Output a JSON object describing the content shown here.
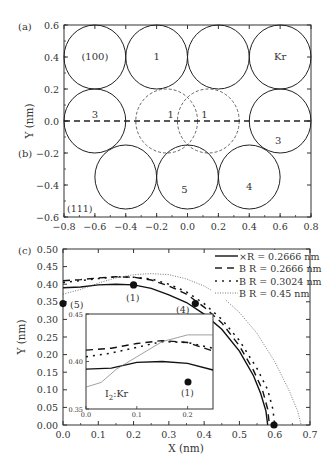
{
  "chart_data": [
    {
      "type": "scatter",
      "panel": "(a)/(b)",
      "title": "",
      "panel_labels": [
        "(a)",
        "(b)"
      ],
      "xlabel": "",
      "ylabel": "Y (nm)",
      "xlim": [
        -0.8,
        0.8
      ],
      "ylim": [
        -0.6,
        0.6
      ],
      "xticks": [
        "-0.8",
        "-0.6",
        "-0.4",
        "-0.2",
        "0.0",
        "0.2",
        "0.4",
        "0.6",
        "0.8"
      ],
      "yticks": [
        "0.6",
        "0.4",
        "0.2",
        "0.0",
        "-0.2",
        "-0.4",
        "-0.6"
      ],
      "annotations": [
        "(100)",
        "(111)"
      ],
      "circles_top_solid": [
        {
          "cx": -0.6,
          "cy": 0.4,
          "r": 0.2,
          "label": "(100)"
        },
        {
          "cx": -0.2,
          "cy": 0.4,
          "r": 0.2,
          "label": "1"
        },
        {
          "cx": 0.2,
          "cy": 0.4,
          "r": 0.2,
          "label": ""
        },
        {
          "cx": 0.6,
          "cy": 0.4,
          "r": 0.2,
          "label": "Kr"
        },
        {
          "cx": -0.6,
          "cy": 0.0,
          "r": 0.2,
          "label": "3"
        },
        {
          "cx": 0.6,
          "cy": 0.0,
          "r": 0.2,
          "label": "3"
        }
      ],
      "circles_dashed": [
        {
          "cx": -0.135,
          "cy": 0.0,
          "r": 0.2,
          "label": "1"
        },
        {
          "cx": 0.135,
          "cy": 0.0,
          "r": 0.2,
          "label": "1"
        }
      ],
      "circles_bottom_solid": [
        {
          "cx": -0.4,
          "cy": -0.35,
          "r": 0.2,
          "label": ""
        },
        {
          "cx": 0.0,
          "cy": -0.35,
          "r": 0.2,
          "label": "5"
        },
        {
          "cx": 0.4,
          "cy": -0.35,
          "r": 0.2,
          "label": "4"
        }
      ],
      "dashed_axis_line": {
        "y": 0.0,
        "x_from": -0.8,
        "x_to": 0.8
      },
      "grid": false
    },
    {
      "type": "line",
      "panel": "(c)",
      "panel_label": "(c)",
      "title": "",
      "xlabel": "X (nm)",
      "ylabel": "Y (nm)",
      "xlim": [
        0.0,
        0.7
      ],
      "ylim": [
        0.0,
        0.5
      ],
      "xticks": [
        "0.0",
        "0.1",
        "0.2",
        "0.3",
        "0.4",
        "0.5",
        "0.6",
        "0.7"
      ],
      "yticks": [
        "0.00",
        "0.05",
        "0.10",
        "0.15",
        "0.20",
        "0.25",
        "0.30",
        "0.35",
        "0.40",
        "0.45",
        "0.50"
      ],
      "legend_position": "upper right",
      "series": [
        {
          "name": "×R = 0.2666 nm",
          "style": "solid",
          "x": [
            0.0,
            0.05,
            0.1,
            0.15,
            0.2,
            0.25,
            0.3,
            0.35,
            0.4,
            0.45,
            0.5,
            0.54,
            0.56,
            0.575,
            0.58
          ],
          "y": [
            0.39,
            0.392,
            0.398,
            0.4,
            0.398,
            0.388,
            0.37,
            0.348,
            0.315,
            0.272,
            0.21,
            0.14,
            0.09,
            0.04,
            0.0
          ]
        },
        {
          "name": "B R = 0.2666 nm",
          "style": "dash",
          "x": [
            0.0,
            0.05,
            0.1,
            0.15,
            0.2,
            0.25,
            0.3,
            0.35,
            0.4,
            0.45,
            0.5,
            0.54,
            0.565,
            0.58,
            0.585
          ],
          "y": [
            0.41,
            0.413,
            0.418,
            0.421,
            0.42,
            0.412,
            0.395,
            0.372,
            0.335,
            0.29,
            0.225,
            0.155,
            0.1,
            0.045,
            0.0
          ]
        },
        {
          "name": "B R = 0.3024 nm",
          "style": "dot",
          "x": [
            0.0,
            0.05,
            0.1,
            0.15,
            0.2,
            0.25,
            0.3,
            0.35,
            0.4,
            0.45,
            0.5,
            0.55,
            0.58,
            0.595,
            0.6
          ],
          "y": [
            0.405,
            0.41,
            0.416,
            0.421,
            0.42,
            0.415,
            0.4,
            0.378,
            0.345,
            0.3,
            0.24,
            0.16,
            0.1,
            0.045,
            0.0
          ]
        },
        {
          "name": "B R = 0.45 nm",
          "style": "fine-dot",
          "x": [
            0.0,
            0.05,
            0.1,
            0.15,
            0.2,
            0.25,
            0.3,
            0.35,
            0.4,
            0.45,
            0.5,
            0.55,
            0.6,
            0.64,
            0.665,
            0.675
          ],
          "y": [
            0.372,
            0.385,
            0.403,
            0.418,
            0.427,
            0.43,
            0.427,
            0.415,
            0.395,
            0.365,
            0.32,
            0.26,
            0.18,
            0.1,
            0.04,
            0.0
          ]
        }
      ],
      "markers": [
        {
          "x": 0.0,
          "y": 0.345,
          "label": "(5)"
        },
        {
          "x": 0.2,
          "y": 0.398,
          "label": "(1)"
        },
        {
          "x": 0.375,
          "y": 0.345,
          "label": "(4)"
        },
        {
          "x": 0.598,
          "y": 0.0,
          "label": ""
        }
      ],
      "inset": {
        "label": "I₂:Kr",
        "xlim": [
          0.0,
          0.25
        ],
        "ylim": [
          0.35,
          0.45
        ],
        "xticks": [
          "0.0",
          "0.1",
          "0.2"
        ],
        "yticks": [
          "0.35",
          "0.40",
          "0.45"
        ],
        "marker": {
          "x": 0.2,
          "y": 0.398,
          "label": "(1)"
        },
        "series": [
          {
            "name": "×R = 0.2666 nm",
            "style": "solid",
            "x": [
              0.0,
              0.05,
              0.1,
              0.15,
              0.2,
              0.25
            ],
            "y": [
              0.392,
              0.393,
              0.399,
              0.4,
              0.398,
              0.391
            ]
          },
          {
            "name": "B R = 0.2666 nm",
            "style": "dash",
            "x": [
              0.0,
              0.05,
              0.1,
              0.15,
              0.2,
              0.25
            ],
            "y": [
              0.412,
              0.414,
              0.419,
              0.422,
              0.42,
              0.411
            ]
          },
          {
            "name": "B R = 0.3024 nm",
            "style": "dot",
            "x": [
              0.0,
              0.05,
              0.1,
              0.15,
              0.2,
              0.25
            ],
            "y": [
              0.405,
              0.409,
              0.415,
              0.421,
              0.42,
              0.414
            ]
          },
          {
            "name": "B R = 0.45 nm",
            "style": "fine-dot",
            "x": [
              0.0,
              0.03,
              0.06,
              0.1,
              0.15,
              0.2,
              0.25
            ],
            "y": [
              0.373,
              0.378,
              0.392,
              0.405,
              0.421,
              0.428,
              0.428
            ]
          }
        ]
      },
      "grid": false
    }
  ],
  "labels": {
    "panel_a": "(a)",
    "panel_b": "(b)",
    "panel_c": "(c)",
    "face_100": "(100)",
    "face_111": "(111)",
    "y_label_top": "Y (nm)",
    "y_label_bottom": "Y (nm)",
    "x_label_bottom": "X (nm)",
    "inset_label_I": "I",
    "inset_label_sub": "2",
    "inset_label_rest": ":Kr",
    "marker_5": "(5)",
    "marker_1": "(1)",
    "marker_4": "(4)",
    "inset_marker_1": "(1)"
  },
  "legend": [
    "×R = 0.2666 nm",
    "B R = 0.2666 nm",
    "B R = 0.3024 nm",
    "B R = 0.45 nm"
  ]
}
